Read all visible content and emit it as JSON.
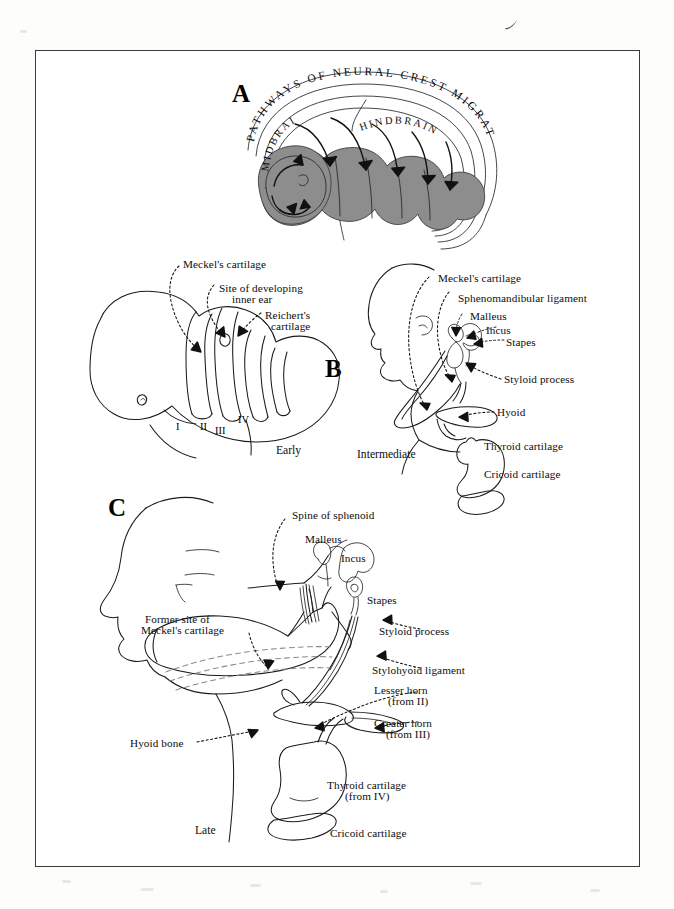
{
  "figure": {
    "panels": [
      {
        "id": "A",
        "letter": "A",
        "title": "PATHWAYS OF NEURAL CREST MIGRATION",
        "region_labels": [
          "MIDBRAIN",
          "HINDBRAIN"
        ]
      },
      {
        "id": "B",
        "letter": "B",
        "stages": [
          {
            "name": "Early",
            "caption": "Early",
            "labels": [
              "Meckel's cartilage",
              "Site of developing\ninner ear",
              "Reichert's\ncartilage"
            ],
            "arch_numerals": [
              "I",
              "II",
              "III",
              "IV"
            ]
          },
          {
            "name": "Intermediate",
            "caption": "Intermediate",
            "labels": [
              "Meckel's cartilage",
              "Sphenomandibular ligament",
              "Malleus",
              "Incus",
              "Stapes",
              "Styloid process",
              "Hyoid",
              "Thyroid cartilage",
              "Cricoid cartilage"
            ]
          }
        ]
      },
      {
        "id": "C",
        "letter": "C",
        "stage_caption": "Late",
        "labels": [
          "Spine of sphenoid",
          "Malleus",
          "Incus",
          "Stapes",
          "Former site of\nMeckel's cartilage",
          "Styloid process",
          "Stylohyoid ligament",
          "Lesser horn\n(from II)",
          "Greater horn\n(from III)",
          "Hyoid bone",
          "Thyroid cartilage\n(from IV)",
          "Cricoid cartilage"
        ]
      }
    ]
  },
  "panelA": {
    "letter": "A",
    "title_chars": "PATHWAYS OF NEURAL CREST MIGRATION",
    "midbrain": "MIDBRAIN",
    "hindbrain": "HINDBRAIN"
  },
  "panelB": {
    "letter": "B",
    "early": {
      "caption": "Early",
      "meckel": "Meckel's cartilage",
      "inner_ear_l1": "Site of developing",
      "inner_ear_l2": "inner ear",
      "reichert_l1": "Reichert's",
      "reichert_l2": "cartilage",
      "numerals": {
        "one": "I",
        "two": "II",
        "three": "III",
        "four": "IV"
      }
    },
    "intermediate": {
      "caption": "Intermediate",
      "meckel": "Meckel's cartilage",
      "sphenomandibular": "Sphenomandibular ligament",
      "malleus": "Malleus",
      "incus": "Incus",
      "stapes": "Stapes",
      "styloid": "Styloid process",
      "hyoid": "Hyoid",
      "thyroid": "Thyroid cartilage",
      "cricoid": "Cricoid cartilage"
    }
  },
  "panelC": {
    "letter": "C",
    "caption": "Late",
    "spine_of_sphenoid": "Spine of sphenoid",
    "malleus": "Malleus",
    "incus": "Incus",
    "stapes": "Stapes",
    "former_site_l1": "Former site of",
    "former_site_l2": "Meckel's cartilage",
    "styloid": "Styloid process",
    "stylohyoid": "Stylohyoid ligament",
    "lesser_horn_l1": "Lesser horn",
    "lesser_horn_l2": "(from II)",
    "greater_horn_l1": "Greater horn",
    "greater_horn_l2": "(from III)",
    "hyoid_bone": "Hyoid bone",
    "thyroid_l1": "Thyroid cartilage",
    "thyroid_l2": "(from IV)",
    "cricoid": "Cricoid cartilage"
  },
  "colors": {
    "ink": "#1b1b1b",
    "shade": "#8d8d8d",
    "frame": "#3a3a3a",
    "page": "#fdfdfc",
    "paper": "#ffffff"
  }
}
